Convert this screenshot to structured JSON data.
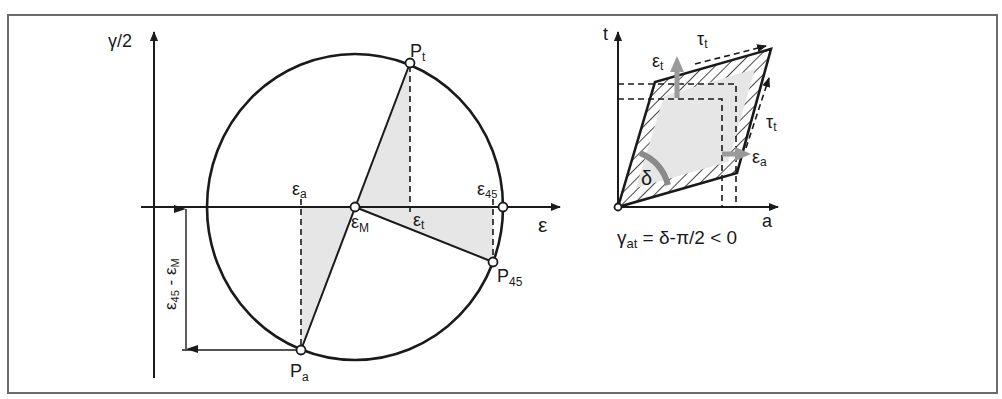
{
  "figure": {
    "frame_color": "#6a6a6a",
    "shade_color": "#e6e6e6",
    "arrow_grey": "#9a9a9a"
  },
  "mohr_circle": {
    "y_axis_label": "γ/2",
    "x_axis_label": "ε",
    "points": {
      "P_t": {
        "main": "P",
        "sub": "t"
      },
      "P_a": {
        "main": "P",
        "sub": "a"
      },
      "P_45": {
        "main": "P",
        "sub": "45"
      }
    },
    "strain_labels": {
      "eps_a": {
        "main": "ε",
        "sub": "a"
      },
      "eps_M": {
        "main": "ε",
        "sub": "M"
      },
      "eps_t": {
        "main": "ε",
        "sub": "t"
      },
      "eps_45": {
        "main": "ε",
        "sub": "45"
      }
    },
    "dimension_label": {
      "main1": "ε",
      "sub1": "45",
      "sep": " - ",
      "main2": "ε",
      "sub2": "M"
    }
  },
  "element_diagram": {
    "t_axis_label": "t",
    "a_axis_label": "a",
    "tau_top": {
      "main": "τ",
      "sub": "t"
    },
    "tau_right": {
      "main": "τ",
      "sub": "t"
    },
    "eps_t": {
      "main": "ε",
      "sub": "t"
    },
    "eps_a": {
      "main": "ε",
      "sub": "a"
    },
    "delta": "δ",
    "formula": {
      "main": "γ",
      "sub": "at",
      "rest": " = δ-π/2 < 0"
    }
  }
}
